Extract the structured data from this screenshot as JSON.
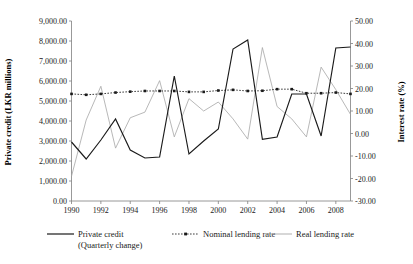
{
  "chart_data": {
    "type": "line",
    "title": "",
    "xlabel": "",
    "ylabel": "Private credit (LKR millions)",
    "y2label": "Interest rate (%)",
    "grid": false,
    "legend_position": "bottom",
    "xlim": [
      1990,
      2009
    ],
    "ylim": [
      0,
      9000
    ],
    "y2lim": [
      -30,
      50
    ],
    "x_tick_labels": [
      "1990",
      "1992",
      "1994",
      "1996",
      "1998",
      "2000",
      "2002",
      "2004",
      "2006",
      "2008"
    ],
    "x_tick_values": [
      1990,
      1992,
      1994,
      1996,
      1998,
      2000,
      2002,
      2004,
      2006,
      2008
    ],
    "y_tick_labels": [
      "0.00",
      "1,000.00",
      "2,000.00",
      "3,000.00",
      "4,000.00",
      "5,000.00",
      "6,000.00",
      "7,000.00",
      "8,000.00",
      "9,000.00"
    ],
    "y_tick_values": [
      0,
      1000,
      2000,
      3000,
      4000,
      5000,
      6000,
      7000,
      8000,
      9000
    ],
    "y2_tick_labels": [
      "-30.00",
      "-20.00",
      "-10.00",
      "0.00",
      "10.00",
      "20.00",
      "30.00",
      "40.00",
      "50.00"
    ],
    "y2_tick_values": [
      -30,
      -20,
      -10,
      0,
      10,
      20,
      30,
      40,
      50
    ],
    "x": [
      1990,
      1991,
      1992,
      1993,
      1994,
      1995,
      1996,
      1997,
      1998,
      1999,
      2000,
      2001,
      2002,
      2003,
      2004,
      2005,
      2006,
      2007,
      2008,
      2009
    ],
    "series": [
      {
        "name": "Private credit (Quarterly change)",
        "axis": "left",
        "style": "solid-black",
        "values": [
          2950,
          2100,
          3050,
          4100,
          2550,
          2150,
          2200,
          6250,
          2350,
          3000,
          3600,
          7600,
          8050,
          3080,
          3200,
          5350,
          5350,
          3250,
          7650,
          7700
        ]
      },
      {
        "name": "Nominal lending rate",
        "axis": "right",
        "style": "dotted-black-markers",
        "values": [
          17.6,
          17.2,
          17.6,
          18.2,
          18.6,
          18.9,
          18.9,
          18.9,
          18.5,
          18.5,
          19.1,
          19.4,
          18.9,
          19.0,
          19.7,
          19.7,
          17.9,
          17.9,
          18.2,
          17.6
        ]
      },
      {
        "name": "Real lending rate",
        "axis": "right",
        "style": "thin-gray",
        "values": [
          -19.0,
          6.0,
          21.0,
          -6.5,
          7.0,
          9.5,
          23.5,
          -1.5,
          15.5,
          10.0,
          14.0,
          6.5,
          -2.5,
          38.2,
          12.0,
          6.5,
          -1.5,
          29.5,
          19.5,
          8.5
        ]
      }
    ]
  },
  "axes": {
    "left_title": "Private credit (LKR millions)",
    "right_title": "Interest rate (%)"
  },
  "legend": {
    "items": [
      {
        "label_line1": "Private credit",
        "label_line2": "(Quarterly change)",
        "marker": "solid-line"
      },
      {
        "label_line1": "Nominal lending rate",
        "label_line2": "",
        "marker": "dotted-line-with-square-marker"
      },
      {
        "label_line1": "Real lending rate",
        "label_line2": "",
        "marker": "thin-gray-line"
      }
    ]
  },
  "colors": {
    "credit_line": "#1a1a1a",
    "nominal_line": "#1a1a1a",
    "real_line": "#a6a6a6",
    "axis": "#7f7f7f",
    "background": "#ffffff"
  }
}
